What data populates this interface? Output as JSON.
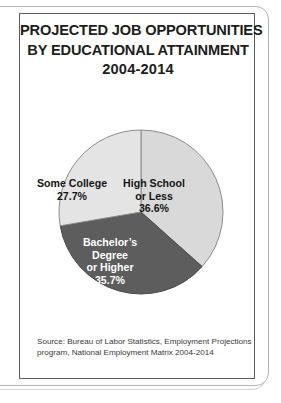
{
  "document": {
    "title_lines": [
      "PROJECTED JOB OPPORTUNITIES",
      "BY EDUCATIONAL ATTAINMENT",
      "2004-2014"
    ],
    "source_lines": [
      "Source: Bureau of Labor Statistics, Employment Projections",
      "program, National Employment Matrix 2004-2014"
    ]
  },
  "chart_data": {
    "type": "pie",
    "title": "PROJECTED JOB OPPORTUNITIES BY EDUCATIONAL ATTAINMENT 2004-2014",
    "categories": [
      "High School or Less",
      "Bachelor's Degree or Higher",
      "Some College"
    ],
    "values": [
      36.6,
      35.7,
      27.7
    ],
    "unit": "%",
    "legend": "none",
    "labels_inside": true,
    "slices": [
      {
        "name": "High School or Less",
        "label_line1": "High School",
        "label_line2": "or Less",
        "value": 36.6,
        "value_text": "36.6%",
        "color": "#d9d9d9",
        "text_color": "#141414",
        "start_angle": 0,
        "end_angle": 131.76
      },
      {
        "name": "Bachelor's Degree or Higher",
        "label_line1": "Bachelor’s",
        "label_line2": "Degree",
        "label_line3": "or Higher",
        "value": 35.7,
        "value_text": "35.7%",
        "color": "#5d5d5d",
        "text_color": "#ffffff",
        "start_angle": 131.76,
        "end_angle": 260.28
      },
      {
        "name": "Some College",
        "label_line1": "Some College",
        "value": 27.7,
        "value_text": "27.7%",
        "color": "#e4e4e4",
        "text_color": "#141414",
        "start_angle": 260.28,
        "end_angle": 360
      }
    ]
  }
}
